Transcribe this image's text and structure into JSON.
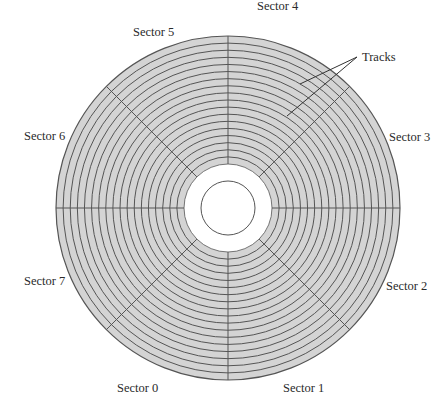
{
  "diagram": {
    "type": "disk-platter",
    "center": {
      "x": 228,
      "y": 208
    },
    "outer_radius": 172,
    "inner_band_radius": 44,
    "hole_radius": 27,
    "track_count": 18,
    "sector_count": 8,
    "colors": {
      "platter_fill": "#d4d4d4",
      "track_stroke": "#555555",
      "sector_stroke": "#555555",
      "band_fill": "#ffffff",
      "background": "#ffffff"
    }
  },
  "labels": {
    "sector_0": "Sector 0",
    "sector_1": "Sector 1",
    "sector_2": "Sector 2",
    "sector_3": "Sector 3",
    "sector_4": "Sector 4",
    "sector_5": "Sector 5",
    "sector_6": "Sector 6",
    "sector_7": "Sector 7",
    "tracks": "Tracks"
  },
  "callouts": {
    "tracks_origin": {
      "x": 357,
      "y": 57
    },
    "tracks_targets": [
      {
        "x": 300,
        "y": 84
      },
      {
        "x": 287,
        "y": 116
      }
    ]
  }
}
